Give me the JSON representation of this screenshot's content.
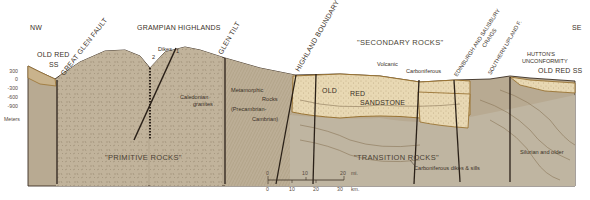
{
  "directions": {
    "left": "NW",
    "right": "SE"
  },
  "depth_axis": {
    "ticks": [
      "300",
      "0",
      "-300",
      "-600",
      "-900"
    ],
    "unit_label": "Meters"
  },
  "region_labels": {
    "primitive": "\"PRIMITIVE ROCKS\"",
    "secondary": "\"SECONDARY ROCKS\"",
    "transition": "\"TRANSITION ROCKS\""
  },
  "top_labels": {
    "grampian": "GRAMPIAN HIGHLANDS",
    "old_red_ss_left_1": "OLD RED",
    "old_red_ss_left_2": "SS",
    "great_glen": "GREAT GLEN FAULT",
    "dikes": "Dikes",
    "dike_1": "1",
    "dike_2": "2",
    "glen_tilt": "GLEN TILT",
    "highland_boundary": "HIGHLAND  BOUNDARY F.",
    "volcanic": "Volcanic",
    "carboniferous": "Carboniferous",
    "edinburgh": "EDINBURGH AND SALISBURY",
    "craigs": "CRAIGS",
    "southern_upland": "SOUTHERN UPLAND F.",
    "hutton_1": "HUTTON'S",
    "hutton_2": "UNCONFORMITY",
    "old_red_ss_right": "OLD RED SS"
  },
  "rock_labels": {
    "caledonian_1": "Caledonian",
    "caledonian_2": "granites",
    "meta_1": "Metamorphic",
    "meta_2": "Rocks",
    "meta_3": "(Precambrian-",
    "meta_4": "Cambrian)",
    "ors_1": "OLD",
    "ors_2": "RED",
    "ors_3": "SANDSTONE",
    "silurian": "Silurian and older",
    "carb_dikes": "Carboniferous dikes & sills"
  },
  "scale_bar": {
    "miles": [
      "0",
      "10",
      "20"
    ],
    "miles_unit": "mi.",
    "km": [
      "0",
      "10",
      "20",
      "30"
    ],
    "km_unit": "km."
  },
  "colors": {
    "basement": "#b9ab94",
    "granite": "#c2b49c",
    "sandstone": "#e6d5b0",
    "silurian": "#bdb39f",
    "outline": "#3a2e22",
    "sandstone_edge": "#9a7434"
  }
}
